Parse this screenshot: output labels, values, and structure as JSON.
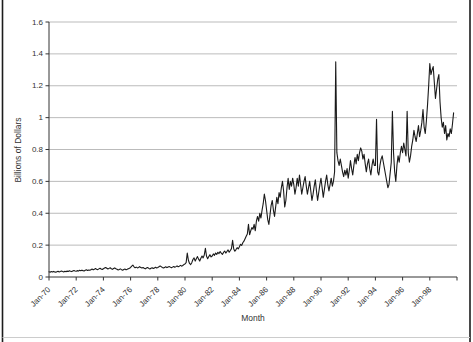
{
  "frame": {
    "left_border_color": "#1c1c1c",
    "right_border_color": "#1c1c1c",
    "bottom_rule_color": "#cccccc",
    "background": "#ffffff"
  },
  "chart_data": {
    "type": "line",
    "title": "",
    "xlabel": "Month",
    "ylabel": "Billions of Dollars",
    "x_start": "Jan-1970",
    "x_end": "Oct-1999",
    "x_tick_interval_months": 24,
    "x_tick_labels": [
      "Jan-70",
      "Jan-72",
      "Jan-74",
      "Jan-76",
      "Jan-78",
      "Jan-80",
      "Jan-82",
      "Jan-84",
      "Jan-86",
      "Jan-88",
      "Jan-90",
      "Jan-92",
      "Jan-94",
      "Jan-96",
      "Jan-98"
    ],
    "y_ticks": [
      0,
      0.2,
      0.4,
      0.6,
      0.8,
      1,
      1.2,
      1.4,
      1.6
    ],
    "y_tick_labels": [
      "0",
      "0.2",
      "0.4",
      "0.6",
      "0.8",
      "1",
      "1.2",
      "1.4",
      "1.6"
    ],
    "ylim": [
      0,
      1.6
    ],
    "xlim_months": [
      0,
      360
    ],
    "grid": "horizontal",
    "legend": "none",
    "line_color": "#1a1a1a",
    "grid_color": "#aaaaaa",
    "axis_color": "#333333",
    "text_color": "#333333",
    "values": [
      0.033,
      0.03,
      0.034,
      0.031,
      0.035,
      0.032,
      0.03,
      0.033,
      0.036,
      0.032,
      0.034,
      0.037,
      0.034,
      0.032,
      0.036,
      0.033,
      0.037,
      0.035,
      0.039,
      0.036,
      0.034,
      0.038,
      0.041,
      0.038,
      0.036,
      0.04,
      0.037,
      0.042,
      0.039,
      0.043,
      0.04,
      0.038,
      0.042,
      0.045,
      0.041,
      0.044,
      0.042,
      0.046,
      0.05,
      0.045,
      0.048,
      0.053,
      0.049,
      0.046,
      0.051,
      0.055,
      0.05,
      0.047,
      0.052,
      0.056,
      0.06,
      0.055,
      0.05,
      0.054,
      0.058,
      0.052,
      0.048,
      0.053,
      0.057,
      0.052,
      0.048,
      0.044,
      0.047,
      0.051,
      0.046,
      0.043,
      0.047,
      0.05,
      0.045,
      0.048,
      0.052,
      0.055,
      0.06,
      0.068,
      0.075,
      0.064,
      0.058,
      0.062,
      0.057,
      0.06,
      0.065,
      0.059,
      0.056,
      0.06,
      0.055,
      0.051,
      0.056,
      0.06,
      0.054,
      0.05,
      0.055,
      0.058,
      0.053,
      0.057,
      0.061,
      0.057,
      0.06,
      0.064,
      0.07,
      0.065,
      0.06,
      0.056,
      0.06,
      0.064,
      0.059,
      0.062,
      0.066,
      0.062,
      0.058,
      0.062,
      0.066,
      0.061,
      0.065,
      0.07,
      0.064,
      0.068,
      0.073,
      0.068,
      0.072,
      0.078,
      0.082,
      0.09,
      0.15,
      0.105,
      0.085,
      0.078,
      0.09,
      0.11,
      0.12,
      0.1,
      0.115,
      0.128,
      0.112,
      0.1,
      0.118,
      0.132,
      0.12,
      0.138,
      0.18,
      0.13,
      0.115,
      0.128,
      0.14,
      0.126,
      0.132,
      0.145,
      0.136,
      0.15,
      0.142,
      0.155,
      0.147,
      0.16,
      0.15,
      0.142,
      0.154,
      0.163,
      0.15,
      0.16,
      0.17,
      0.156,
      0.166,
      0.178,
      0.23,
      0.176,
      0.162,
      0.172,
      0.184,
      0.176,
      0.19,
      0.205,
      0.198,
      0.215,
      0.225,
      0.24,
      0.255,
      0.27,
      0.33,
      0.265,
      0.29,
      0.31,
      0.3,
      0.33,
      0.29,
      0.35,
      0.38,
      0.35,
      0.4,
      0.37,
      0.42,
      0.46,
      0.52,
      0.48,
      0.42,
      0.36,
      0.33,
      0.39,
      0.45,
      0.48,
      0.42,
      0.38,
      0.44,
      0.5,
      0.46,
      0.53,
      0.5,
      0.56,
      0.6,
      0.54,
      0.44,
      0.48,
      0.56,
      0.62,
      0.55,
      0.6,
      0.57,
      0.62,
      0.58,
      0.52,
      0.56,
      0.62,
      0.57,
      0.64,
      0.58,
      0.52,
      0.56,
      0.6,
      0.63,
      0.57,
      0.52,
      0.56,
      0.6,
      0.54,
      0.48,
      0.52,
      0.57,
      0.61,
      0.54,
      0.48,
      0.53,
      0.58,
      0.62,
      0.56,
      0.5,
      0.55,
      0.6,
      0.64,
      0.58,
      0.54,
      0.58,
      0.62,
      0.57,
      0.6,
      0.66,
      1.35,
      0.78,
      0.73,
      0.7,
      0.74,
      0.7,
      0.66,
      0.63,
      0.67,
      0.64,
      0.68,
      0.62,
      0.67,
      0.73,
      0.68,
      0.64,
      0.7,
      0.75,
      0.71,
      0.77,
      0.73,
      0.78,
      0.81,
      0.79,
      0.74,
      0.77,
      0.71,
      0.66,
      0.71,
      0.74,
      0.68,
      0.64,
      0.7,
      0.74,
      0.7,
      0.7,
      0.99,
      0.66,
      0.64,
      0.7,
      0.74,
      0.76,
      0.72,
      0.68,
      0.64,
      0.6,
      0.56,
      0.58,
      0.65,
      0.72,
      1.04,
      0.78,
      0.66,
      0.6,
      0.7,
      0.76,
      0.72,
      0.78,
      0.82,
      0.78,
      0.84,
      0.8,
      0.76,
      1.04,
      0.78,
      0.72,
      0.76,
      0.82,
      0.86,
      0.92,
      0.88,
      0.85,
      0.9,
      0.95,
      0.88,
      0.92,
      0.97,
      1.05,
      0.94,
      0.9,
      0.98,
      1.08,
      1.2,
      1.34,
      1.27,
      1.3,
      1.32,
      1.22,
      1.12,
      1.18,
      1.24,
      1.27,
      1.1,
      1.0,
      0.94,
      0.97,
      0.9,
      0.95,
      0.86,
      0.9,
      0.88,
      0.93,
      0.9,
      0.96,
      1.03
    ]
  }
}
